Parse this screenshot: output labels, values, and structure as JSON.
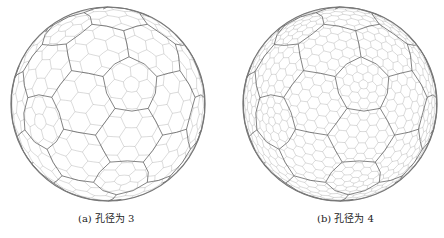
{
  "figure": {
    "panels": [
      {
        "id": "a",
        "caption": "(a) 孔径为 3",
        "aperture": 3,
        "subdivisions": 3,
        "cx": 108,
        "cy": 104,
        "r": 97
      },
      {
        "id": "b",
        "caption": "(b) 孔径为 4",
        "aperture": 4,
        "subdivisions": 5,
        "cx": 118,
        "cy": 104,
        "r": 97
      }
    ],
    "colors": {
      "line": "#555555",
      "fine_line": "#9a9a9a",
      "background": "#ffffff"
    }
  }
}
